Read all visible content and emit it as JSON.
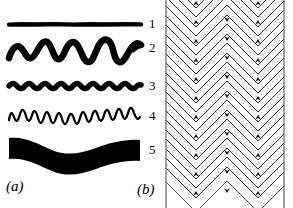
{
  "figure": {
    "width": 293,
    "height": 208,
    "background": "#ffffff",
    "ink": "#000000"
  },
  "panels": [
    {
      "caption": "(a)",
      "name": "panel-a-curve-styles",
      "description": "Five line styles drawn as black curves of varying thickness, amplitude and wavelength, each numbered at its right end."
    },
    {
      "caption": "(b)",
      "name": "panel-b-chevron-folds",
      "description": "Cross-section of chevron (zigzag) folded stratigraphic layers, alternating stippled and white bands between two vertical boundary lines."
    }
  ],
  "curves": [
    {
      "label": "1",
      "label_x": 150,
      "label_y": 17,
      "baseline_y": 24,
      "thickness": 4.2,
      "amplitude": 0,
      "wavelength": 0,
      "style": "straight-thick-line"
    },
    {
      "label": "2",
      "label_x": 150,
      "label_y": 41,
      "baseline_y": 51,
      "thickness": 6.5,
      "amplitude": 10,
      "wavelength": 30,
      "style": "thick-irregular-wave"
    },
    {
      "label": "3",
      "label_x": 150,
      "label_y": 79,
      "baseline_y": 85,
      "thickness": 5.2,
      "amplitude": 3,
      "wavelength": 16,
      "style": "thick-low-amplitude-wave"
    },
    {
      "label": "4",
      "label_x": 150,
      "label_y": 109,
      "baseline_y": 115,
      "thickness": 2.2,
      "amplitude": 8,
      "wavelength": 13,
      "style": "thin-high-frequency-sinusoid"
    },
    {
      "label": "5",
      "label_x": 150,
      "label_y": 143,
      "baseline_y": 150,
      "thickness": 22,
      "amplitude": 6,
      "wavelength": 60,
      "style": "very-thick-undulating-band"
    }
  ],
  "chevron": {
    "left_boundary_x": 6,
    "right_boundary_x": 124,
    "fold_period_x": 62,
    "layer_spacing_y": 19,
    "band_count": 11,
    "fill_stipple": "#000000",
    "fill_blank": "#ffffff",
    "stroke": "#000000"
  }
}
